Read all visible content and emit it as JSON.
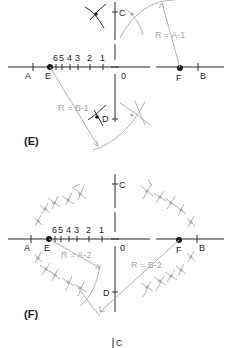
{
  "colors": {
    "ink": "#2a2a2a",
    "construction": "#a8a8a8",
    "background": "#ffffff"
  },
  "panel_e": {
    "label": "(E)",
    "points": {
      "A": "A",
      "B": "B",
      "C": "C",
      "D": "D",
      "E": "E",
      "F": "F",
      "O": "0"
    },
    "ticks": [
      "6",
      "5",
      "4",
      "3",
      "2",
      "1"
    ],
    "radius_labels": {
      "a": "R = A-1",
      "b": "R = B-1"
    }
  },
  "panel_f": {
    "label": "(F)",
    "points": {
      "A": "A",
      "B": "B",
      "C": "C",
      "D": "D",
      "E": "E",
      "F": "F",
      "O": "0"
    },
    "ticks": [
      "6",
      "5",
      "4",
      "3",
      "2",
      "1"
    ],
    "radius_labels": {
      "a": "R = A-2",
      "b": "R = B-2"
    }
  },
  "footer": {
    "partial_label": "C"
  }
}
